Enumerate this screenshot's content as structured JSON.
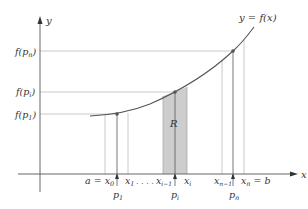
{
  "figure": {
    "curve_label": "y = f(x)",
    "y_axis_label": "y",
    "x_axis_label": "x",
    "region_label": "R",
    "y_ticks": [
      {
        "id": "fpn",
        "base": "f(p",
        "sub": "n",
        "close": ")",
        "y": 51
      },
      {
        "id": "fpi",
        "base": "f(p",
        "sub": "i",
        "close": ")",
        "y": 92
      },
      {
        "id": "fp1",
        "base": "f(p",
        "sub": "1",
        "close": ")",
        "y": 114
      }
    ],
    "x_ticks": [
      {
        "id": "x0",
        "text": "a = x",
        "sub": "0",
        "x": 105
      },
      {
        "id": "x1",
        "text": "x",
        "sub": "1",
        "x": 128
      },
      {
        "id": "dots",
        "text": ". . . ."
      },
      {
        "id": "xim1",
        "text": "x",
        "sub": "i−1",
        "x": 163
      },
      {
        "id": "xi",
        "text": "x",
        "sub": "i",
        "x": 187
      },
      {
        "id": "xnm1",
        "text": "x",
        "sub": "n−1",
        "x": 222
      },
      {
        "id": "xn",
        "text": "x",
        "sub": "n",
        "suffix": " = b",
        "x": 244
      }
    ],
    "sample_points": [
      {
        "id": "p1",
        "text": "p",
        "sub": "1",
        "x": 117
      },
      {
        "id": "pi",
        "text": "p",
        "sub": "i",
        "x": 175
      },
      {
        "id": "pn",
        "text": "p",
        "sub": "n",
        "x": 233
      }
    ],
    "colors": {
      "axis": "#666666",
      "curve": "#555555",
      "guide": "#bbbbbb",
      "shade": "#cccccc",
      "point": "#555555"
    }
  }
}
